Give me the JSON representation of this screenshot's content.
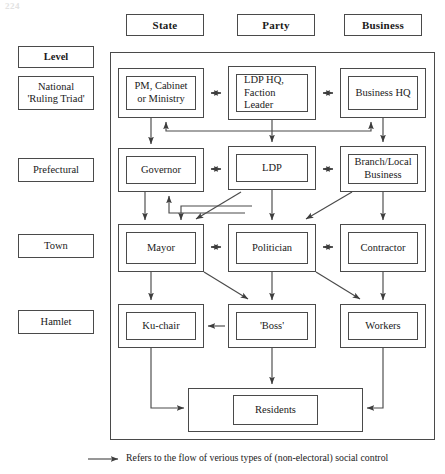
{
  "page": {
    "folio": "224"
  },
  "columns": [
    {
      "id": "state",
      "label": "State"
    },
    {
      "id": "party",
      "label": "Party"
    },
    {
      "id": "business",
      "label": "Business"
    }
  ],
  "levels": [
    {
      "id": "level-header",
      "label": "Level",
      "header": true
    },
    {
      "id": "national",
      "label": "National\n'Ruling Triad'",
      "line1": "National",
      "line2": "'Ruling Triad'"
    },
    {
      "id": "prefectural",
      "label": "Prefectural"
    },
    {
      "id": "town",
      "label": "Town"
    },
    {
      "id": "hamlet",
      "label": "Hamlet"
    }
  ],
  "nodes": [
    {
      "id": "pm-cabinet",
      "level": "national",
      "column": "state",
      "line1": "PM, Cabinet",
      "line2": "or Ministry"
    },
    {
      "id": "ldp-hq",
      "level": "national",
      "column": "party",
      "line1": "LDP HQ,",
      "line2": "Faction",
      "line3": "Leader"
    },
    {
      "id": "business-hq",
      "level": "national",
      "column": "business",
      "line1": "Business HQ"
    },
    {
      "id": "governor",
      "level": "prefectural",
      "column": "state",
      "line1": "Governor"
    },
    {
      "id": "ldp",
      "level": "prefectural",
      "column": "party",
      "line1": "LDP"
    },
    {
      "id": "branch-business",
      "level": "prefectural",
      "column": "business",
      "line1": "Branch/Local",
      "line2": "Business"
    },
    {
      "id": "mayor",
      "level": "town",
      "column": "state",
      "line1": "Mayor"
    },
    {
      "id": "politician",
      "level": "town",
      "column": "party",
      "line1": "Politician"
    },
    {
      "id": "contractor",
      "level": "town",
      "column": "business",
      "line1": "Contractor"
    },
    {
      "id": "ku-chair",
      "level": "hamlet",
      "column": "state",
      "line1": "Ku-chair"
    },
    {
      "id": "boss",
      "level": "hamlet",
      "column": "party",
      "line1": "'Boss'"
    },
    {
      "id": "workers",
      "level": "hamlet",
      "column": "business",
      "line1": "Workers"
    },
    {
      "id": "residents",
      "level": "residents",
      "column": "all",
      "line1": "Residents"
    }
  ],
  "legend": {
    "text": "Refers to the flow of verious types of (non-electoral) social control",
    "marker": "arrow-right-icon"
  },
  "colors": {
    "line": "#4a4a4a",
    "text": "#1a1a1a",
    "background": "#ffffff"
  }
}
